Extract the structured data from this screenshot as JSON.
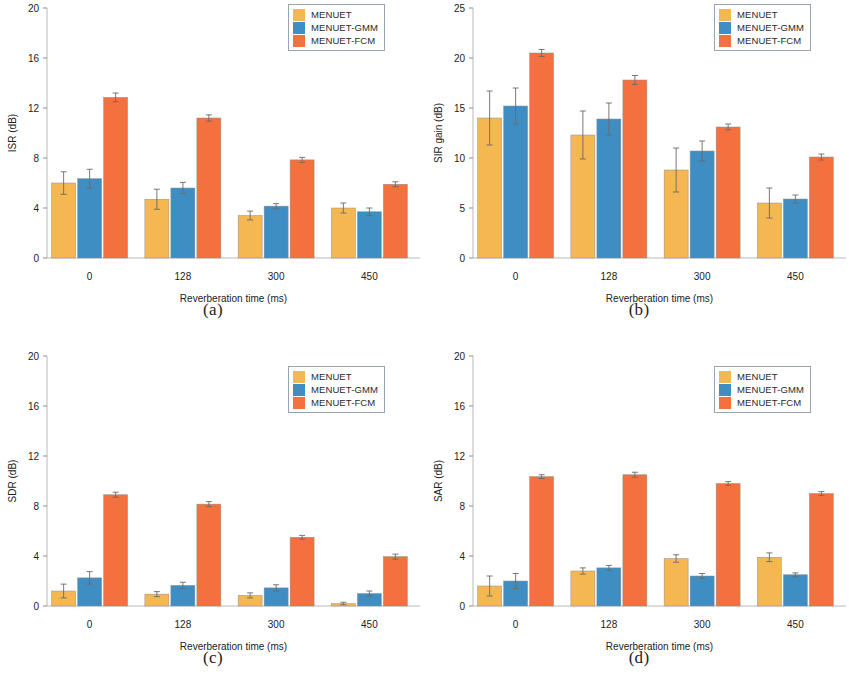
{
  "figure": {
    "panels": [
      "a",
      "b",
      "c",
      "d"
    ],
    "series_colors": {
      "MENUET": "#f5b752",
      "MENUET-GMM": "#3e8ec4",
      "MENUET-FCM": "#f4703f"
    },
    "legend_labels": [
      "MENUET",
      "MENUET-GMM",
      "MENUET-FCM"
    ],
    "xlabel": "Reverberation time (ms)",
    "categories": [
      "0",
      "128",
      "300",
      "450"
    ]
  },
  "captions": {
    "a": "(a)",
    "b": "(b)",
    "c": "(c)",
    "d": "(d)"
  },
  "chart_data": [
    {
      "id": "a",
      "type": "bar",
      "title": "",
      "xlabel": "Reverberation time (ms)",
      "ylabel": "ISR (dB)",
      "categories": [
        "0",
        "128",
        "300",
        "450"
      ],
      "ylim": [
        0,
        20
      ],
      "yticks": [
        0,
        4,
        8,
        12,
        16,
        20
      ],
      "grid": false,
      "legend_position": "top-right",
      "series": [
        {
          "name": "MENUET",
          "color": "#f5b752",
          "values": [
            6.0,
            4.7,
            3.4,
            4.0
          ],
          "errors": [
            0.9,
            0.8,
            0.35,
            0.4
          ]
        },
        {
          "name": "MENUET-GMM",
          "color": "#3e8ec4",
          "values": [
            6.35,
            5.6,
            4.15,
            3.7
          ],
          "errors": [
            0.75,
            0.45,
            0.2,
            0.3
          ]
        },
        {
          "name": "MENUET-FCM",
          "color": "#f4703f",
          "values": [
            12.85,
            11.2,
            7.85,
            5.9
          ],
          "errors": [
            0.35,
            0.25,
            0.2,
            0.2
          ]
        }
      ]
    },
    {
      "id": "b",
      "type": "bar",
      "title": "",
      "xlabel": "Reverberation time (ms)",
      "ylabel": "SIR gain (dB)",
      "categories": [
        "0",
        "128",
        "300",
        "450"
      ],
      "ylim": [
        0,
        25
      ],
      "yticks": [
        0,
        5,
        10,
        15,
        20,
        25
      ],
      "grid": false,
      "legend_position": "top-right",
      "series": [
        {
          "name": "MENUET",
          "color": "#f5b752",
          "values": [
            14.0,
            12.3,
            8.8,
            5.5
          ],
          "errors": [
            2.7,
            2.4,
            2.2,
            1.5
          ]
        },
        {
          "name": "MENUET-GMM",
          "color": "#3e8ec4",
          "values": [
            15.2,
            13.9,
            10.7,
            5.9
          ],
          "errors": [
            1.8,
            1.6,
            1.0,
            0.4
          ]
        },
        {
          "name": "MENUET-FCM",
          "color": "#f4703f",
          "values": [
            20.5,
            17.8,
            13.1,
            10.1
          ],
          "errors": [
            0.35,
            0.45,
            0.3,
            0.3
          ]
        }
      ]
    },
    {
      "id": "c",
      "type": "bar",
      "title": "",
      "xlabel": "Reverberation time (ms)",
      "ylabel": "SDR (dB)",
      "categories": [
        "0",
        "128",
        "300",
        "450"
      ],
      "ylim": [
        0,
        20
      ],
      "yticks": [
        0,
        4,
        8,
        12,
        16,
        20
      ],
      "grid": false,
      "legend_position": "top-right",
      "series": [
        {
          "name": "MENUET",
          "color": "#f5b752",
          "values": [
            1.2,
            0.95,
            0.85,
            0.2
          ],
          "errors": [
            0.55,
            0.2,
            0.2,
            0.1
          ]
        },
        {
          "name": "MENUET-GMM",
          "color": "#3e8ec4",
          "values": [
            2.25,
            1.65,
            1.45,
            1.0
          ],
          "errors": [
            0.5,
            0.25,
            0.25,
            0.2
          ]
        },
        {
          "name": "MENUET-FCM",
          "color": "#f4703f",
          "values": [
            8.9,
            8.15,
            5.5,
            3.95
          ],
          "errors": [
            0.2,
            0.2,
            0.15,
            0.2
          ]
        }
      ]
    },
    {
      "id": "d",
      "type": "bar",
      "title": "",
      "xlabel": "Reverberation time (ms)",
      "ylabel": "SAR (dB)",
      "categories": [
        "0",
        "128",
        "300",
        "450"
      ],
      "ylim": [
        0,
        20
      ],
      "yticks": [
        0,
        4,
        8,
        12,
        16,
        20
      ],
      "grid": false,
      "legend_position": "top-right",
      "series": [
        {
          "name": "MENUET",
          "color": "#f5b752",
          "values": [
            1.6,
            2.8,
            3.8,
            3.9
          ],
          "errors": [
            0.8,
            0.25,
            0.3,
            0.35
          ]
        },
        {
          "name": "MENUET-GMM",
          "color": "#3e8ec4",
          "values": [
            2.0,
            3.05,
            2.4,
            2.5
          ],
          "errors": [
            0.6,
            0.2,
            0.2,
            0.15
          ]
        },
        {
          "name": "MENUET-FCM",
          "color": "#f4703f",
          "values": [
            10.35,
            10.5,
            9.8,
            9.0
          ],
          "errors": [
            0.15,
            0.2,
            0.15,
            0.15
          ]
        }
      ]
    }
  ]
}
